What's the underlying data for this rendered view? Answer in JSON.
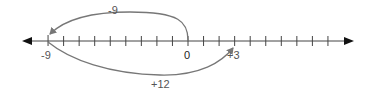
{
  "diagram": {
    "type": "number-line",
    "range": [
      -10,
      10
    ],
    "tick_min": -9,
    "tick_max": 9,
    "labeled_points": [
      {
        "value": -9,
        "label": "-9"
      },
      {
        "value": 0,
        "label": "0"
      },
      {
        "value": 3,
        "label": "+3"
      }
    ],
    "jumps": [
      {
        "from": 0,
        "to": -9,
        "label": "-9",
        "side": "above"
      },
      {
        "from": -9,
        "to": 3,
        "label": "+12",
        "side": "below"
      }
    ],
    "colors": {
      "axis": "#222222",
      "arc": "#777777",
      "text": "#555555"
    }
  }
}
